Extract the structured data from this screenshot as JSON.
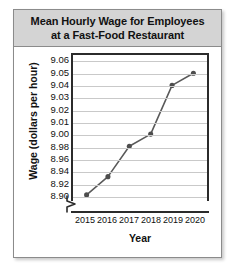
{
  "chart_data": {
    "type": "line",
    "title": "Mean Hourly Wage for Employees at a Fast-Food Restaurant",
    "title_lines": [
      "Mean Hourly Wage for Employees",
      "at a Fast-Food Restaurant"
    ],
    "xlabel": "Year",
    "ylabel": "Wage (dollars per hour)",
    "categories": [
      "2015",
      "2016",
      "2017",
      "2018",
      "2019",
      "2020"
    ],
    "x": [
      2015,
      2016,
      2017,
      2018,
      2019,
      2020
    ],
    "values": [
      8.9,
      8.93,
      8.98,
      9.0,
      9.04,
      9.05
    ],
    "series": [
      {
        "name": "Mean hourly wage",
        "values": [
          8.9,
          8.93,
          8.98,
          9.0,
          9.04,
          9.05
        ]
      }
    ],
    "ytick_labels": [
      "9.06",
      "9.05",
      "9.04",
      "9.03",
      "9.02",
      "9.01",
      "9.00",
      "8.98",
      "8.96",
      "8.94",
      "8.92",
      "8.90"
    ],
    "ytick_values": [
      9.06,
      9.05,
      9.04,
      9.03,
      9.02,
      9.01,
      9.0,
      8.98,
      8.96,
      8.94,
      8.92,
      8.9
    ],
    "zero_tick_label": "0",
    "axis_break": true,
    "ylim": [
      8.9,
      9.06
    ],
    "grid": true,
    "legend": "none",
    "line_color": "#595959",
    "marker_color": "#4d4d4d",
    "gridline_color": "#c9c9c9",
    "axis_color": "#2b2b2b",
    "title_band_color": "#d4d4d4"
  }
}
